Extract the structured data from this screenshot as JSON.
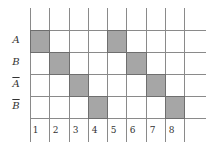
{
  "diagram": {
    "rows": [
      {
        "label": "A",
        "negated": false
      },
      {
        "label": "B",
        "negated": false
      },
      {
        "label": "A",
        "negated": true
      },
      {
        "label": "B",
        "negated": true
      }
    ],
    "columns": [
      "1",
      "2",
      "3",
      "4",
      "5",
      "6",
      "7",
      "8"
    ],
    "shaded_cells": [
      {
        "row": 0,
        "col": 1
      },
      {
        "row": 1,
        "col": 2
      },
      {
        "row": 2,
        "col": 3
      },
      {
        "row": 3,
        "col": 4
      },
      {
        "row": 0,
        "col": 5
      },
      {
        "row": 1,
        "col": 6
      },
      {
        "row": 2,
        "col": 7
      },
      {
        "row": 3,
        "col": 8
      }
    ],
    "colors": {
      "shade": "#a6a6a6",
      "line": "#8a8a8a"
    }
  }
}
